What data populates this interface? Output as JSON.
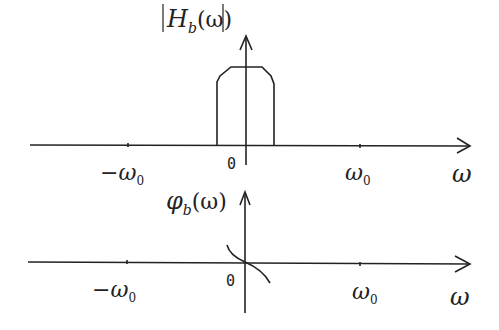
{
  "diagram": {
    "magnitude_plot": {
      "ylabel_main": "H",
      "ylabel_sub": "b",
      "ylabel_arg": "(ω)",
      "xlabel": "ω",
      "origin_label": "0",
      "tick_neg_label": "−ω",
      "tick_neg_sub": "0",
      "tick_pos_label": "ω",
      "tick_pos_sub": "0"
    },
    "phase_plot": {
      "ylabel_main": "φ",
      "ylabel_sub": "b",
      "ylabel_arg": "(ω)",
      "xlabel": "ω",
      "origin_label": "0",
      "tick_neg_label": "−ω",
      "tick_neg_sub": "0",
      "tick_pos_label": "ω",
      "tick_pos_sub": "0"
    },
    "colors": {
      "stroke": "#222222",
      "background": "#ffffff"
    }
  }
}
